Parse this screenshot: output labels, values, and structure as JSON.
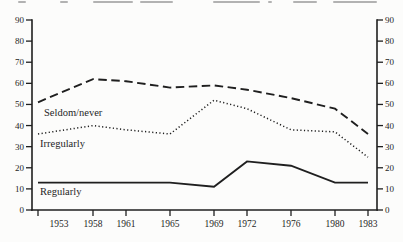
{
  "figure": {
    "ink_color": "#1f1f1f",
    "background_color": "#fcfcfb",
    "cropped_caption": {
      "visible": true,
      "legible": false,
      "fragments": [
        {
          "x": 18,
          "w": 8
        },
        {
          "x": 60,
          "w": 8
        },
        {
          "x": 93,
          "w": 40
        },
        {
          "x": 140,
          "w": 33
        },
        {
          "x": 213,
          "w": 47
        },
        {
          "x": 268,
          "w": 4
        },
        {
          "x": 293,
          "w": 24
        },
        {
          "x": 333,
          "w": 44
        }
      ]
    }
  },
  "chart_data": {
    "type": "line",
    "x": [
      1953,
      1958,
      1961,
      1965,
      1969,
      1972,
      1976,
      1980,
      1983
    ],
    "xtick_labels": [
      "1953",
      "1958",
      "1961",
      "1965",
      "1969",
      "1972",
      "1976",
      "1980",
      "1983"
    ],
    "yticks": [
      0,
      10,
      20,
      30,
      40,
      50,
      60,
      70,
      80,
      90
    ],
    "ylim": [
      0,
      90
    ],
    "y_axis_sides": [
      "left",
      "right"
    ],
    "grid": false,
    "legend": "inline labels next to lines",
    "title": "",
    "xlabel": "",
    "ylabel": "",
    "series": [
      {
        "name": "Seldom/never",
        "line_style": "dashed",
        "values": [
          51,
          62,
          61,
          58,
          59,
          57,
          53,
          48,
          36
        ]
      },
      {
        "name": "Irregularly",
        "line_style": "dotted",
        "values": [
          36,
          40,
          38,
          36,
          52,
          48,
          38,
          37,
          25
        ]
      },
      {
        "name": "Regularly",
        "line_style": "solid",
        "values": [
          13,
          13,
          13,
          13,
          11,
          23,
          21,
          13,
          13
        ]
      }
    ]
  }
}
